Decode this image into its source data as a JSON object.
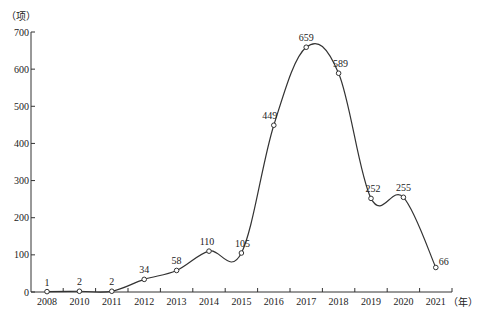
{
  "chart_data": {
    "type": "line",
    "title": "",
    "xlabel": "（年）",
    "ylabel": "（项）",
    "categories": [
      "2008",
      "2010",
      "2011",
      "2012",
      "2013",
      "2014",
      "2015",
      "2016",
      "2017",
      "2018",
      "2019",
      "2020",
      "2021"
    ],
    "series": [
      {
        "name": "count",
        "values": [
          1,
          2,
          2,
          34,
          58,
          110,
          105,
          449,
          659,
          589,
          252,
          255,
          66
        ]
      }
    ],
    "data_labels": [
      "1",
      "2",
      "2",
      "34",
      "58",
      "110",
      "105",
      "449",
      "659",
      "589",
      "252",
      "255",
      "66"
    ],
    "ylim": [
      0,
      700
    ],
    "yticks": [
      0,
      100,
      200,
      300,
      400,
      500,
      600,
      700
    ],
    "grid": false,
    "legend": "none",
    "line_style": "smooth curve with hollow circle markers",
    "colors": {
      "line": "#333333",
      "axis": "#333333",
      "marker_fill": "#ffffff"
    }
  }
}
